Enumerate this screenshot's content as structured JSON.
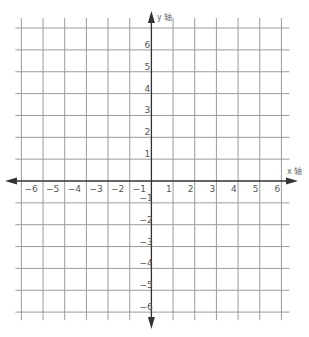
{
  "diagram": {
    "type": "cartesian-coordinate-grid",
    "x_axis": {
      "label": "x 轴",
      "min": -6,
      "max": 6,
      "ticks": [
        -6,
        -5,
        -4,
        -3,
        -2,
        -1,
        1,
        2,
        3,
        4,
        5,
        6
      ]
    },
    "y_axis": {
      "label": "y 轴",
      "min": -6,
      "max": 7,
      "ticks": [
        -6,
        -5,
        -4,
        -3,
        -2,
        -1,
        1,
        2,
        3,
        4,
        5,
        6
      ]
    },
    "colors": {
      "grid": "#9a9a9a",
      "axis": "#333333",
      "label": "#555555",
      "background": "#ffffff"
    }
  }
}
